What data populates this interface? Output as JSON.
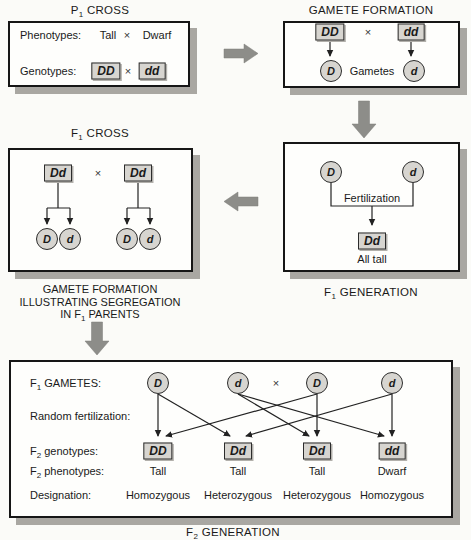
{
  "colors": {
    "bg": "#fbfbf8",
    "panel_border": "#161616",
    "panel_shadow": "#a9a7a2",
    "allele_fill": "#d7d5d0",
    "block_arrow": "#8d8d89",
    "line": "#222222",
    "text": "#1a1a1a"
  },
  "p1_cross": {
    "title": {
      "pre": "P",
      "sub": "1",
      "post": " CROSS"
    },
    "phenotypes_label": "Phenotypes:",
    "phenotype_left": "Tall",
    "cross_symbol": "×",
    "phenotype_right": "Dwarf",
    "genotypes_label": "Genotypes:",
    "genotype_left": "DD",
    "genotype_right": "dd"
  },
  "gamete_formation": {
    "title": "GAMETE FORMATION",
    "parent_left": "DD",
    "cross_symbol": "×",
    "parent_right": "dd",
    "gamete_left": "D",
    "gametes_label": "Gametes",
    "gamete_right": "d"
  },
  "f1_cross": {
    "title": {
      "pre": "F",
      "sub": "1",
      "post": " CROSS"
    },
    "parent_left": "Dd",
    "cross_symbol": "×",
    "parent_right": "Dd",
    "gametes_left": [
      "D",
      "d"
    ],
    "gametes_right": [
      "D",
      "d"
    ],
    "caption_line1": "GAMETE FORMATION",
    "caption_line2": "ILLUSTRATING SEGREGATION",
    "caption_line3": {
      "pre": "IN F",
      "sub": "1",
      "post": " PARENTS"
    }
  },
  "f1_generation": {
    "gamete_left": "D",
    "gamete_right": "d",
    "fertilization_label": "Fertilization",
    "offspring": "Dd",
    "result_label": "All tall",
    "caption": {
      "pre": "F",
      "sub": "1",
      "post": " GENERATION"
    }
  },
  "f2_panel": {
    "gametes_label": {
      "pre": "F",
      "sub": "1",
      "post": " GAMETES:"
    },
    "gametes": [
      "D",
      "d",
      "D",
      "d"
    ],
    "cross_symbol": "×",
    "random_fert_label": "Random fertilization:",
    "genotypes_label": {
      "pre": "F",
      "sub": "2",
      "post": " genotypes:"
    },
    "genotypes": [
      "DD",
      "Dd",
      "Dd",
      "dd"
    ],
    "phenotypes_label": {
      "pre": "F",
      "sub": "2",
      "post": " phenotypes:"
    },
    "phenotypes": [
      "Tall",
      "Tall",
      "Tall",
      "Dwarf"
    ],
    "designation_label": "Designation:",
    "designations": [
      "Homozygous",
      "Heterozygous",
      "Heterozygous",
      "Homozygous"
    ],
    "caption": {
      "pre": "F",
      "sub": "2",
      "post": " GENERATION"
    }
  }
}
